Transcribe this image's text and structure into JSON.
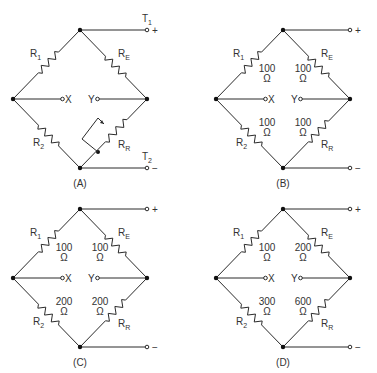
{
  "figure": {
    "diagrams": [
      {
        "id": "A",
        "caption": "(A)",
        "terminal_pos_label": "T",
        "terminal_pos_sub": "1",
        "terminal_pos_sign": "+",
        "terminal_neg_label": "T",
        "terminal_neg_sub": "2",
        "terminal_neg_sign": "−",
        "x_label": "X",
        "y_label": "Y",
        "resistors": {
          "r1": {
            "name": "R",
            "sub": "1",
            "value": "",
            "unit": ""
          },
          "re": {
            "name": "R",
            "sub": "E",
            "value": "",
            "unit": ""
          },
          "r2": {
            "name": "R",
            "sub": "2",
            "value": "",
            "unit": ""
          },
          "rr": {
            "name": "R",
            "sub": "R",
            "value": "",
            "unit": "",
            "variable": true
          }
        }
      },
      {
        "id": "B",
        "caption": "(B)",
        "terminal_pos_sign": "+",
        "terminal_neg_sign": "−",
        "x_label": "X",
        "y_label": "Y",
        "resistors": {
          "r1": {
            "name": "R",
            "sub": "1",
            "value": "100",
            "unit": "Ω"
          },
          "re": {
            "name": "R",
            "sub": "E",
            "value": "100",
            "unit": "Ω"
          },
          "r2": {
            "name": "R",
            "sub": "2",
            "value": "100",
            "unit": "Ω"
          },
          "rr": {
            "name": "R",
            "sub": "R",
            "value": "100",
            "unit": "Ω"
          }
        }
      },
      {
        "id": "C",
        "caption": "(C)",
        "terminal_pos_sign": "+",
        "terminal_neg_sign": "−",
        "x_label": "X",
        "y_label": "Y",
        "resistors": {
          "r1": {
            "name": "R",
            "sub": "1",
            "value": "100",
            "unit": "Ω"
          },
          "re": {
            "name": "R",
            "sub": "E",
            "value": "100",
            "unit": "Ω"
          },
          "r2": {
            "name": "R",
            "sub": "2",
            "value": "200",
            "unit": "Ω"
          },
          "rr": {
            "name": "R",
            "sub": "R",
            "value": "200",
            "unit": "Ω"
          }
        }
      },
      {
        "id": "D",
        "caption": "(D)",
        "terminal_pos_sign": "+",
        "terminal_neg_sign": "−",
        "x_label": "X",
        "y_label": "Y",
        "resistors": {
          "r1": {
            "name": "R",
            "sub": "1",
            "value": "100",
            "unit": "Ω"
          },
          "re": {
            "name": "R",
            "sub": "E",
            "value": "200",
            "unit": "Ω"
          },
          "r2": {
            "name": "R",
            "sub": "2",
            "value": "300",
            "unit": "Ω"
          },
          "rr": {
            "name": "R",
            "sub": "R",
            "value": "600",
            "unit": "Ω"
          }
        }
      }
    ]
  }
}
